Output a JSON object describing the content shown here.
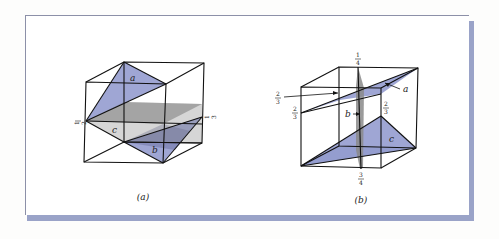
{
  "figure": {
    "panels": [
      {
        "caption": "(a)",
        "planes": [
          {
            "label": "a",
            "color": "#8e97cc"
          },
          {
            "label": "b",
            "color": "#8e97cc"
          },
          {
            "label": "c",
            "color": "#9a9a9a"
          }
        ],
        "intercepts": [
          {
            "num": "1",
            "den": "2"
          },
          {
            "num": "1",
            "den": "3"
          }
        ]
      },
      {
        "caption": "(b)",
        "planes": [
          {
            "label": "a",
            "color": "#8e97cc"
          },
          {
            "label": "b",
            "color": "#8a8a8a"
          },
          {
            "label": "c",
            "color": "#8e97cc"
          }
        ],
        "intercepts": [
          {
            "num": "1",
            "den": "4"
          },
          {
            "num": "2",
            "den": "3"
          },
          {
            "num": "2",
            "den": "3"
          },
          {
            "num": "2",
            "den": "3"
          },
          {
            "num": "3",
            "den": "4"
          }
        ]
      }
    ],
    "colors": {
      "plane_blue": "#8e97cc",
      "plane_gray": "#9a9a9a",
      "frame_shadow": "#9aa3c8",
      "edge": "#111111"
    }
  }
}
